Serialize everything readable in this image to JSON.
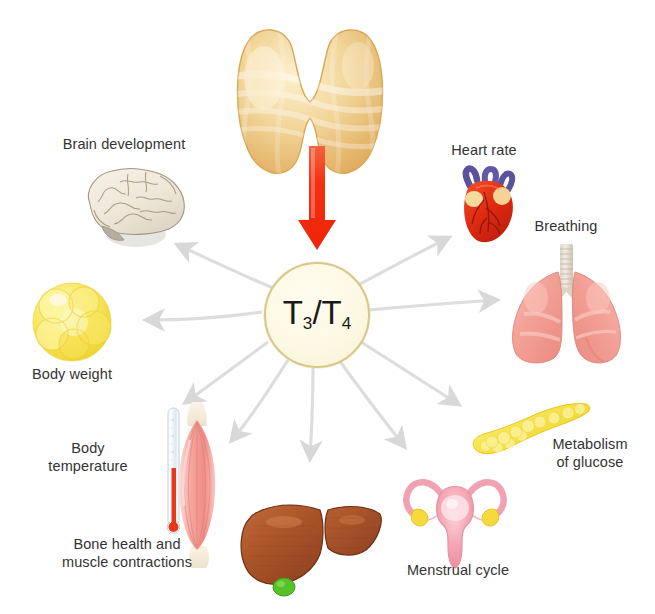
{
  "diagram": {
    "source_gland": {
      "name": "thyroid-gland",
      "color": "#e8b96a"
    },
    "hormone": {
      "text_full": "T3/T4",
      "base_1": "T",
      "sub_1": "3",
      "separator": "/",
      "base_2": "T",
      "sub_2": "4",
      "circle_fill": "#fdf8e2",
      "circle_border": "#d8c888"
    },
    "main_arrow": {
      "name": "thyroid-to-hormone-arrow",
      "color": "#f02d10",
      "direction": "down"
    },
    "radiating_arrow_color": "#dcdcdc",
    "effects": [
      {
        "id": "brain-development",
        "label": "Brain development",
        "organ": "brain",
        "label_lines": [
          "Brain development"
        ],
        "color": "#ece4d6"
      },
      {
        "id": "body-weight",
        "label": "Body weight",
        "organ": "fat-cells",
        "label_lines": [
          "Body weight"
        ],
        "color": "#f7e14f"
      },
      {
        "id": "body-temperature",
        "label": "Body temperature",
        "organ": "thermometer",
        "label_lines": [
          "Body",
          "temperature"
        ],
        "color": "#e23b20"
      },
      {
        "id": "bone-health-and-muscle-contractions",
        "label": "Bone health and muscle contractions",
        "organ": "muscle",
        "label_lines": [
          "Bone health and",
          "muscle contractions"
        ],
        "color": "#f09a95"
      },
      {
        "id": "liver",
        "label": "",
        "organ": "liver",
        "label_lines": [],
        "color": "#a9522a"
      },
      {
        "id": "menstrual-cycle",
        "label": "Menstrual cycle",
        "organ": "uterus",
        "label_lines": [
          "Menstrual cycle"
        ],
        "color": "#f4a7b4"
      },
      {
        "id": "metabolism-of-glucose",
        "label": "Metabolism of glucose",
        "organ": "pancreas",
        "label_lines": [
          "Metabolism",
          "of glucose"
        ],
        "color": "#f4de3a"
      },
      {
        "id": "breathing",
        "label": "Breathing",
        "organ": "lungs",
        "label_lines": [
          "Breathing"
        ],
        "color": "#f3a096"
      },
      {
        "id": "heart-rate",
        "label": "Heart rate",
        "organ": "heart",
        "label_lines": [
          "Heart rate"
        ],
        "color": "#e0301a"
      }
    ]
  },
  "labels": {
    "brain_development": "Brain development",
    "heart_rate": "Heart rate",
    "breathing": "Breathing",
    "body_weight": "Body weight",
    "body_temperature_l1": "Body",
    "body_temperature_l2": "temperature",
    "bone_muscle_l1": "Bone health and",
    "bone_muscle_l2": "muscle contractions",
    "menstrual_cycle": "Menstrual cycle",
    "metabolism_l1": "Metabolism",
    "metabolism_l2": "of glucose"
  }
}
